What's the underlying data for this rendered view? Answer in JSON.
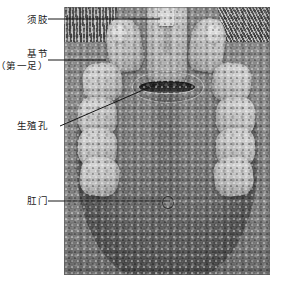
{
  "figure": {
    "type": "scanning-electron-micrograph",
    "plate": {
      "background_tone": "#7d7d7d",
      "frame_color": "#5a5a5a"
    },
    "labels": [
      {
        "id": "palp",
        "text": "须肢",
        "lines": [
          "须肢"
        ],
        "leader": {
          "style": "straight-horizontal",
          "x1": 48,
          "y1": 19,
          "x2": 160,
          "y2": 19
        }
      },
      {
        "id": "coxa-first-leg",
        "text": "基节（第一足）",
        "lines": [
          "基节",
          "（第一足）"
        ],
        "leader": {
          "style": "straight-horizontal",
          "x1": 48,
          "y1": 60,
          "x2": 106,
          "y2": 60
        }
      },
      {
        "id": "genital-pore",
        "text": "生殖孔",
        "lines": [
          "生殖孔"
        ],
        "leader": {
          "style": "diagonal",
          "x1": 60,
          "y1": 126,
          "x2": 157,
          "y2": 84
        }
      },
      {
        "id": "anus",
        "text": "肛门",
        "lines": [
          "肛门"
        ],
        "leader": {
          "style": "straight-horizontal",
          "x1": 48,
          "y1": 201,
          "x2": 170,
          "y2": 201
        }
      }
    ],
    "structures": {
      "capitulum": "capitulum",
      "chelicera": "chelicera",
      "palp_left": "pedipalp-left",
      "palp_right": "pedipalp-right",
      "genital_pore": "genital-pore",
      "anus": "anus",
      "coxae": [
        "coxa-I",
        "coxa-II",
        "coxa-III",
        "coxa-IV"
      ]
    },
    "caption": ""
  }
}
